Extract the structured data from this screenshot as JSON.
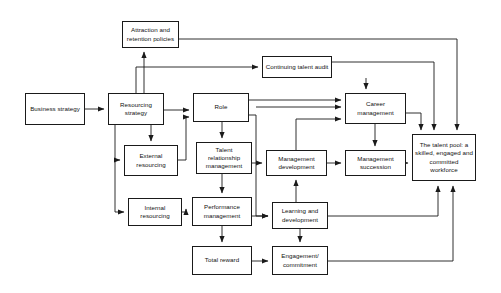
{
  "diagram": {
    "type": "flowchart",
    "background_color": "#ffffff",
    "line_color": "#1a1a1a",
    "text_color": "#111111",
    "nodes": [
      {
        "id": "attraction-retention-policies",
        "label": "Attraction and retention policies",
        "x": 122,
        "y": 21,
        "w": 57,
        "h": 27
      },
      {
        "id": "business-strategy",
        "label": "Business strategy",
        "x": 25,
        "y": 93,
        "w": 60,
        "h": 32
      },
      {
        "id": "resourcing-strategy",
        "label": "Resourcing strategy",
        "x": 108,
        "y": 93,
        "w": 56,
        "h": 32
      },
      {
        "id": "continuing-talent-audit",
        "label": "Continuing talent audit",
        "x": 262,
        "y": 56,
        "w": 70,
        "h": 22
      },
      {
        "id": "role",
        "label": "Role",
        "x": 193,
        "y": 93,
        "w": 56,
        "h": 29
      },
      {
        "id": "career-management",
        "label": "Career management",
        "x": 345,
        "y": 93,
        "w": 61,
        "h": 31
      },
      {
        "id": "external-resourcing",
        "label": "External resourcing",
        "x": 124,
        "y": 145,
        "w": 54,
        "h": 31
      },
      {
        "id": "talent-relationship-management",
        "label": "Talent relationship management",
        "x": 196,
        "y": 142,
        "w": 56,
        "h": 32
      },
      {
        "id": "management-development",
        "label": "Management development",
        "x": 266,
        "y": 150,
        "w": 61,
        "h": 26
      },
      {
        "id": "management-succession",
        "label": "Management succession",
        "x": 345,
        "y": 150,
        "w": 61,
        "h": 26
      },
      {
        "id": "talent-pool",
        "label": "The talent pool: a skilled, engaged and committed workforce",
        "x": 412,
        "y": 134,
        "w": 64,
        "h": 47
      },
      {
        "id": "internal-resourcing",
        "label": "Internal resourcing",
        "x": 128,
        "y": 198,
        "w": 54,
        "h": 28
      },
      {
        "id": "performance-management",
        "label": "Performance management",
        "x": 192,
        "y": 197,
        "w": 60,
        "h": 29
      },
      {
        "id": "learning-and-development",
        "label": "Learning and development",
        "x": 272,
        "y": 202,
        "w": 56,
        "h": 27
      },
      {
        "id": "total-reward",
        "label": "Total reward",
        "x": 192,
        "y": 246,
        "w": 60,
        "h": 29
      },
      {
        "id": "engagement-commitment",
        "label": "Engagement/ commitment",
        "x": 272,
        "y": 246,
        "w": 56,
        "h": 29
      }
    ],
    "connectors": [
      {
        "id": "business-strategy-to-resourcing-strategy",
        "from": "business-strategy",
        "to": "resourcing-strategy",
        "path": "M 85 109 L 104 109"
      },
      {
        "id": "resourcing-strategy-to-attraction-retention",
        "from": "resourcing-strategy",
        "to": "attraction-retention-policies",
        "path": "M 144 93 L 144 52"
      },
      {
        "id": "resourcing-strategy-to-role",
        "from": "resourcing-strategy",
        "to": "role",
        "path": "M 164 110 L 189 110"
      },
      {
        "id": "resourcing-strategy-to-external-resourcing",
        "from": "resourcing-strategy",
        "to": "external-resourcing",
        "path": "M 151 125 L 151 141"
      },
      {
        "id": "resourcing-strategy-left-down-to-external",
        "from": "resourcing-strategy",
        "to": "external-resourcing",
        "path": "M 115 125 L 115 160 L 120 160"
      },
      {
        "id": "resourcing-strategy-left-down-to-internal",
        "from": "resourcing-strategy",
        "to": "internal-resourcing",
        "path": "M 115 160 L 115 212 L 124 212"
      },
      {
        "id": "external-resourcing-to-role-input",
        "from": "external-resourcing",
        "to": "role",
        "path": "M 178 160 L 186 160 L 186 117 L 189 117"
      },
      {
        "id": "internal-resourcing-to-performance-management",
        "from": "internal-resourcing",
        "to": "performance-management",
        "path": "M 182 212 L 186 212 L 186 209"
      },
      {
        "id": "role-down-to-talent-relationship",
        "from": "role",
        "to": "talent-relationship-management",
        "path": "M 222 122 L 222 138"
      },
      {
        "id": "talent-relationship-to-performance-management",
        "from": "talent-relationship-management",
        "to": "performance-management",
        "path": "M 222 174 L 222 193"
      },
      {
        "id": "role-to-career-management-1",
        "from": "role",
        "to": "career-management",
        "path": "M 249 100 L 341 100"
      },
      {
        "id": "role-to-career-management-2",
        "from": "role",
        "to": "career-management",
        "path": "M 256 107 L 341 107"
      },
      {
        "id": "management-development-to-career-management",
        "from": "management-development",
        "to": "career-management",
        "path": "M 296 150 L 296 119 L 341 119"
      },
      {
        "id": "continuing-talent-audit-to-career-management",
        "from": "continuing-talent-audit",
        "to": "career-management",
        "path": "M 366 78 L 366 89"
      },
      {
        "id": "resourcing-strategy-to-continuing-talent-audit",
        "from": "resourcing-strategy",
        "to": "continuing-talent-audit",
        "path": "M 136 93 L 136 67 L 258 67"
      },
      {
        "id": "talent-relationship-to-management-development",
        "from": "talent-relationship-management",
        "to": "management-development",
        "path": "M 252 163 L 262 163"
      },
      {
        "id": "career-management-to-management-succession",
        "from": "career-management",
        "to": "management-succession",
        "path": "M 375 124 L 375 146"
      },
      {
        "id": "management-development-to-management-succession",
        "from": "management-development",
        "to": "management-succession",
        "path": "M 327 163 L 341 163"
      },
      {
        "id": "management-succession-to-talent-pool",
        "from": "management-succession",
        "to": "talent-pool",
        "path": "M 406 163 L 408 163"
      },
      {
        "id": "career-management-to-talent-pool",
        "from": "career-management",
        "to": "talent-pool",
        "path": "M 406 113 L 421 113 L 421 130"
      },
      {
        "id": "continuing-talent-audit-to-talent-pool",
        "from": "continuing-talent-audit",
        "to": "talent-pool",
        "path": "M 332 62 L 434 62 L 434 130"
      },
      {
        "id": "attraction-retention-to-talent-pool",
        "from": "attraction-retention-policies",
        "to": "talent-pool",
        "path": "M 179 39 L 457 39 L 457 130"
      },
      {
        "id": "role-to-learning-and-development",
        "from": "role",
        "to": "learning-and-development",
        "path": "M 249 115 L 256 115 L 256 216 L 268 216"
      },
      {
        "id": "performance-management-to-learning-and-development",
        "from": "performance-management",
        "to": "learning-and-development",
        "path": "M 252 216 L 268 216"
      },
      {
        "id": "learning-and-development-to-management-development",
        "from": "learning-and-development",
        "to": "management-development",
        "path": "M 296 202 L 296 180"
      },
      {
        "id": "performance-management-to-total-reward",
        "from": "performance-management",
        "to": "total-reward",
        "path": "M 222 226 L 222 242"
      },
      {
        "id": "learning-and-development-to-engagement",
        "from": "learning-and-development",
        "to": "engagement-commitment",
        "path": "M 300 229 L 300 242"
      },
      {
        "id": "total-reward-to-engagement",
        "from": "total-reward",
        "to": "engagement-commitment",
        "path": "M 252 261 L 268 261"
      },
      {
        "id": "learning-and-development-to-talent-pool",
        "from": "learning-and-development",
        "to": "talent-pool",
        "path": "M 328 216 L 438 216 L 438 186"
      },
      {
        "id": "engagement-to-talent-pool",
        "from": "engagement-commitment",
        "to": "talent-pool",
        "path": "M 328 261 L 453 261 L 453 186"
      }
    ]
  }
}
